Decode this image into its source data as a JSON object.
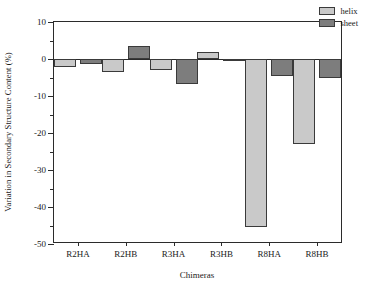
{
  "chart_data": {
    "type": "bar",
    "title": "",
    "xlabel": "Chimeras",
    "ylabel": "Variation in Secondary Structure Content (%)",
    "categories": [
      "R2HA",
      "R2HB",
      "R3HA",
      "R3HB",
      "R8HA",
      "R8HB"
    ],
    "series": [
      {
        "name": "helix",
        "color": "#c9c9c9",
        "values": [
          -2.2,
          -3.5,
          -3.0,
          2.0,
          -45.5,
          -23.0
        ]
      },
      {
        "name": "sheet",
        "color": "#7d7d7d",
        "values": [
          -1.3,
          3.5,
          -6.8,
          -0.2,
          -4.6,
          -5.0
        ]
      }
    ],
    "ylim": [
      -50,
      10
    ],
    "yticks": [
      10,
      0,
      -10,
      -20,
      -30,
      -40,
      -50
    ],
    "ytick_labels": [
      "10",
      "0",
      "-10",
      "-20",
      "-30",
      "-40",
      "-50"
    ],
    "yminor_ticks": [
      5,
      -5,
      -15,
      -25,
      -35,
      -45
    ],
    "grid": false,
    "legend_position": "top-right",
    "legend_entries": [
      "helix",
      "sheet"
    ]
  }
}
